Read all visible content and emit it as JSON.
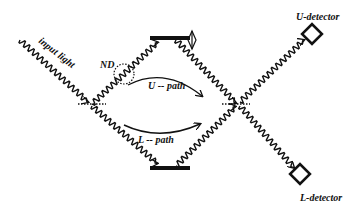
{
  "diagram": {
    "type": "mach-zehnder-interferometer",
    "labels": {
      "input": "input light",
      "nd": "ND",
      "u_path": "U -- path",
      "l_path": "L -- path",
      "u_detector": "U-detector",
      "l_detector": "L-detector"
    },
    "components": [
      {
        "id": "input-beam-splitter",
        "kind": "beam-splitter"
      },
      {
        "id": "upper-mirror",
        "kind": "mirror",
        "movable": true
      },
      {
        "id": "lower-mirror",
        "kind": "mirror"
      },
      {
        "id": "nd-filter",
        "kind": "neutral-density-filter"
      },
      {
        "id": "output-beam-splitter",
        "kind": "beam-splitter"
      },
      {
        "id": "u-detector",
        "kind": "detector"
      },
      {
        "id": "l-detector",
        "kind": "detector"
      }
    ],
    "colors": {
      "ink": "#111111",
      "background": "#ffffff"
    }
  }
}
